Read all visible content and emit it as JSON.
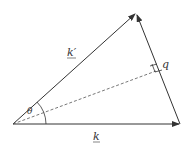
{
  "diagram": {
    "title": "",
    "labels": {
      "k_prime": "k′",
      "k": "k",
      "q": "q",
      "theta": "θ"
    },
    "points": {
      "origin": [
        13,
        124
      ],
      "apex": [
        136,
        13
      ],
      "right": [
        180,
        124
      ],
      "foot": [
        157,
        70
      ]
    },
    "colors": {
      "stroke": "#333333",
      "background": "#ffffff"
    }
  }
}
